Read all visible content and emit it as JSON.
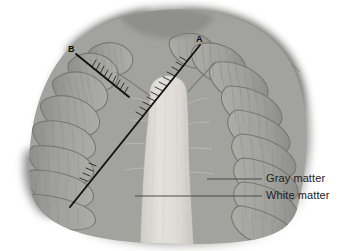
{
  "figure": {
    "background_color": "#ffffff"
  },
  "annotations": {
    "letters": [
      {
        "id": "A",
        "text": "A",
        "x": 200,
        "y": 41
      },
      {
        "id": "B",
        "text": "B",
        "x": 73,
        "y": 50
      }
    ],
    "labels": [
      {
        "id": "gray-matter",
        "text": "Gray matter",
        "leader_from_x": 207,
        "leader_from_y": 179,
        "leader_to_x": 262,
        "leader_to_y": 179
      },
      {
        "id": "white-matter",
        "text": "White matter",
        "leader_from_x": 135,
        "leader_from_y": 196,
        "leader_to_x": 262,
        "leader_to_y": 196
      }
    ],
    "measure_lines": [
      {
        "id": "line-a",
        "label": "A",
        "x1": 200,
        "y1": 45,
        "x2": 70,
        "y2": 207,
        "tick_marks": true
      },
      {
        "id": "line-b",
        "label": "B",
        "x1": 76,
        "y1": 54,
        "x2": 129,
        "y2": 97,
        "tick_marks": true
      }
    ]
  },
  "colors": {
    "gray_matter": "#9b9b97",
    "gray_matter_dark": "#7f7f7c",
    "white_matter": "#dedbd6",
    "outer_tissue": "#74746f",
    "outer_tissue_light": "#8d8d89",
    "fissure_line": "#6a6a66",
    "annotation_line": "#121212",
    "leader_line": "#4a4a4a",
    "text": "#1b1b1b",
    "background": "#ffffff"
  },
  "structure": {
    "left_folia_count": 12,
    "right_folia_count": 13,
    "central_stem_label": "arbor-vitae"
  }
}
